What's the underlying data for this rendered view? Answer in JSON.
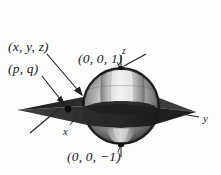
{
  "figure": {
    "labels": {
      "point_xyz": "(x, y, z)",
      "point_pq": "(p, q)",
      "north_pole": "(0, 0, 1)",
      "south_pole": "(0, 0, −1)",
      "axis_z": "z",
      "axis_x": "x",
      "axis_y": "y"
    },
    "colors": {
      "background": "#fdfdfd",
      "ink": "#1a1a1a",
      "sphere_dark": "#2a2a2a",
      "sphere_mid": "#6e6e6e",
      "sphere_light": "#dcdcdc",
      "sphere_highlight": "#f0f0f0",
      "plane_dark": "#232323",
      "plane_mid": "#3c3c3c"
    },
    "geometry": {
      "sphere_center": [
        121,
        106
      ],
      "sphere_radius": 38,
      "plane_left_tip": [
        18,
        110
      ],
      "plane_right_tip": [
        196,
        112
      ],
      "north_pole_marker": [
        121,
        68
      ],
      "south_pole_marker": [
        121,
        145
      ],
      "pq_marker": [
        68,
        109
      ]
    }
  }
}
